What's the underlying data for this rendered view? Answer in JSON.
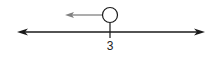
{
  "diagram": {
    "type": "number-line-inequality",
    "tick_label": "3",
    "point_value": 3,
    "point_style": "open-circle",
    "direction": "left",
    "inequality": "x < 3",
    "colors": {
      "line": "#1a1a1a",
      "ray": "#808080",
      "circle_stroke": "#1a1a1a",
      "circle_fill": "#ffffff"
    }
  }
}
